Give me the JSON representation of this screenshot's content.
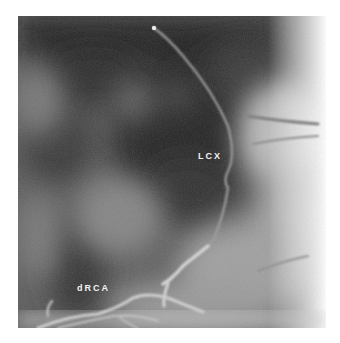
{
  "figure": {
    "type": "coronary angiogram (grayscale)",
    "labels": [
      {
        "id": "lcx",
        "text": "LCX",
        "x": 198,
        "y": 151
      },
      {
        "id": "drca",
        "text": "dRCA",
        "x": 77,
        "y": 283
      }
    ],
    "colors": {
      "background": "#ffffff",
      "dark_tissue": "#2a2a2a",
      "mid_tissue": "#6a6a6a",
      "bright_tissue": "#c8c8c8",
      "vessel": "#d8d8d8",
      "label_text": "#f2f2f2"
    }
  }
}
